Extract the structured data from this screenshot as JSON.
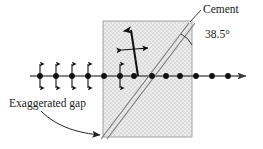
{
  "figure": {
    "labels": {
      "cement": "Cement",
      "angle": "38.5°",
      "gap": "Exaggerated gap"
    },
    "colors": {
      "stroke": "#1a1a1a",
      "axis": "#555555",
      "block_fill": "#e8e8e8",
      "block_border": "#9a9a9a",
      "stipple": "#b0b0b0",
      "text": "#1a1a1a"
    },
    "geometry": {
      "block": {
        "x": 103,
        "y": 21,
        "width": 89,
        "height": 116
      },
      "axis": {
        "x1": 30,
        "y1": 76,
        "x2": 252,
        "y2": 76
      },
      "origin": {
        "x": 138,
        "y": 76
      },
      "cement_line": {
        "x1": 105,
        "y1": 136,
        "x2": 191,
        "y2": 23
      },
      "angle_degrees": 38.5
    },
    "axis_dots": [
      {
        "x": 40,
        "arrows": true
      },
      {
        "x": 56,
        "arrows": true
      },
      {
        "x": 72,
        "arrows": true
      },
      {
        "x": 88,
        "arrows": true
      },
      {
        "x": 104,
        "arrows": false
      },
      {
        "x": 120,
        "arrows": true
      },
      {
        "x": 134,
        "arrows": false
      },
      {
        "x": 152,
        "arrows": false
      },
      {
        "x": 166,
        "arrows": false
      },
      {
        "x": 180,
        "arrows": false
      },
      {
        "x": 196,
        "arrows": false
      },
      {
        "x": 212,
        "arrows": false
      },
      {
        "x": 228,
        "arrows": false
      }
    ],
    "vectors": {
      "displacement": {
        "x1": 138,
        "y1": 76,
        "x2": 131,
        "y2": 26
      },
      "transverse": {
        "x1": 119,
        "y1": 49,
        "x2": 150,
        "y2": 49
      }
    }
  }
}
